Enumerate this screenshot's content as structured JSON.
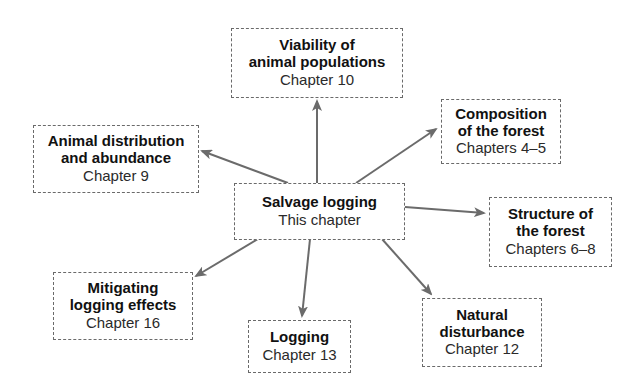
{
  "diagram": {
    "type": "hub-and-spoke concept map",
    "arrow_color": "#6b6b6b",
    "center": {
      "id": "salvage",
      "title": "Salvage logging",
      "subtitle": "This chapter"
    },
    "nodes": [
      {
        "id": "viability",
        "title": "Viability of\nanimal populations",
        "subtitle": "Chapter 10"
      },
      {
        "id": "animal_distribution",
        "title": "Animal distribution\nand abundance",
        "subtitle": "Chapter 9"
      },
      {
        "id": "composition",
        "title": "Composition\nof the forest",
        "subtitle": "Chapters 4–5"
      },
      {
        "id": "structure",
        "title": "Structure of\nthe forest",
        "subtitle": "Chapters 6–8"
      },
      {
        "id": "mitigating",
        "title": "Mitigating\nlogging effects",
        "subtitle": "Chapter 16"
      },
      {
        "id": "logging",
        "title": "Logging",
        "subtitle": "Chapter 13"
      },
      {
        "id": "natural_disturbance",
        "title": "Natural\ndisturbance",
        "subtitle": "Chapter 12"
      }
    ],
    "edges": [
      {
        "from": "salvage",
        "to": "viability"
      },
      {
        "from": "salvage",
        "to": "animal_distribution"
      },
      {
        "from": "salvage",
        "to": "composition"
      },
      {
        "from": "salvage",
        "to": "structure"
      },
      {
        "from": "salvage",
        "to": "mitigating"
      },
      {
        "from": "salvage",
        "to": "logging"
      },
      {
        "from": "salvage",
        "to": "natural_disturbance"
      }
    ]
  }
}
